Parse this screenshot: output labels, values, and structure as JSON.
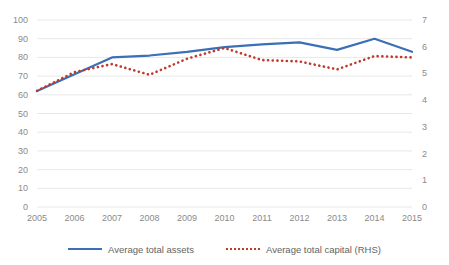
{
  "chart_data": {
    "type": "line",
    "title": "",
    "xlabel": "",
    "ylabel": "",
    "categories": [
      "2005",
      "2006",
      "2007",
      "2008",
      "2009",
      "2010",
      "2011",
      "2012",
      "2013",
      "2014",
      "2015"
    ],
    "ylim": [
      0,
      100
    ],
    "ylim_right": [
      0,
      7
    ],
    "y_ticks": [
      "0",
      "10",
      "20",
      "30",
      "40",
      "50",
      "60",
      "70",
      "80",
      "90",
      "100"
    ],
    "y_ticks_right": [
      "0",
      "1",
      "2",
      "3",
      "4",
      "5",
      "6",
      "7"
    ],
    "grid": true,
    "legend_position": "bottom",
    "series": [
      {
        "name": "Average total assets",
        "axis": "left",
        "style": "solid",
        "color": "#3b6fb6",
        "values": [
          62,
          71,
          80,
          81,
          83,
          85.5,
          87,
          88,
          84,
          90,
          83
        ]
      },
      {
        "name": "Average total capital (RHS)",
        "axis": "right",
        "style": "dotted",
        "color": "#c0392b",
        "values": [
          4.35,
          5.05,
          5.35,
          4.95,
          5.55,
          5.95,
          5.5,
          5.45,
          5.15,
          5.65,
          5.6
        ]
      }
    ]
  },
  "axes": {
    "left_ticks": [
      "100",
      "90",
      "80",
      "70",
      "60",
      "50",
      "40",
      "30",
      "20",
      "10",
      "0"
    ],
    "right_ticks": [
      "7",
      "6",
      "5",
      "4",
      "3",
      "2",
      "1",
      "0"
    ],
    "x_ticks": [
      "2005",
      "2006",
      "2007",
      "2008",
      "2009",
      "2010",
      "2011",
      "2012",
      "2013",
      "2014",
      "2015"
    ]
  },
  "legend": {
    "items": [
      {
        "label": "Average total assets"
      },
      {
        "label": "Average total capital (RHS)"
      }
    ]
  },
  "colors": {
    "series_assets": "#3b6fb6",
    "series_capital": "#c0392b",
    "grid": "#e8e8e8",
    "text": "#8a8a8a"
  }
}
